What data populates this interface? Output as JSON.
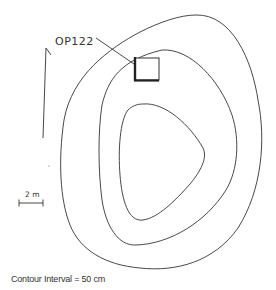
{
  "figure": {
    "label": "OP122",
    "scale_label": "2 m",
    "caption": "Contour Interval = 50 cm",
    "elements": {
      "north_arrow": "north-arrow-icon",
      "contours": [
        "outer-contour",
        "middle-contour",
        "inner-contour"
      ],
      "excavation_unit": "square-unit-marker"
    },
    "colors": {
      "line": "#333333",
      "background": "#ffffff"
    }
  }
}
